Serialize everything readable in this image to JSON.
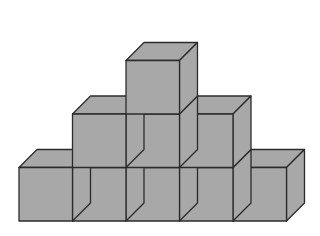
{
  "figure": {
    "description": "Isometric-style stack of 9 identical gray cubes",
    "total_cubes": 9,
    "rows": [
      {
        "level": 1,
        "count": 5,
        "cols": [
          0,
          1,
          2,
          3,
          4
        ]
      },
      {
        "level": 2,
        "count": 3,
        "cols": [
          1,
          2,
          3
        ]
      },
      {
        "level": 3,
        "count": 1,
        "cols": [
          2
        ]
      }
    ],
    "colors": {
      "fill": "#a8a8a8",
      "stroke": "#2b2b2b",
      "background": "#ffffff"
    },
    "geometry": {
      "origin_x": 19,
      "base_y": 221,
      "cube_size": 53.5,
      "depth_dx": 18,
      "depth_dy": -18
    }
  }
}
